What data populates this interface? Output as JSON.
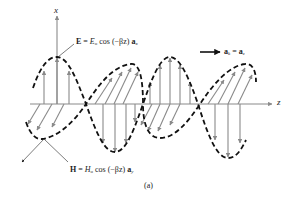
{
  "figure": {
    "caption": "(a)",
    "axes": {
      "x_label": "x",
      "z_label": "z"
    },
    "propagation": {
      "label_lhs": "a",
      "label_lhs_sub": "k",
      "label_eq": " = ",
      "label_rhs": "a",
      "label_rhs_sub": "z"
    },
    "e_field": {
      "symbol": "E",
      "eq": " = ",
      "amp": "E",
      "amp_sub": "o",
      "func": " cos (−βz) ",
      "unit": "a",
      "unit_sub": "x"
    },
    "h_field": {
      "symbol": "H",
      "eq": " = ",
      "amp": "H",
      "amp_sub": "o",
      "func": " cos (−βz) ",
      "unit": "a",
      "unit_sub": "y"
    },
    "colors": {
      "wave_envelope": "#111111",
      "field_arrows": "#8a8a8a",
      "axes": "#8a8a8a",
      "text": "#222222"
    }
  }
}
